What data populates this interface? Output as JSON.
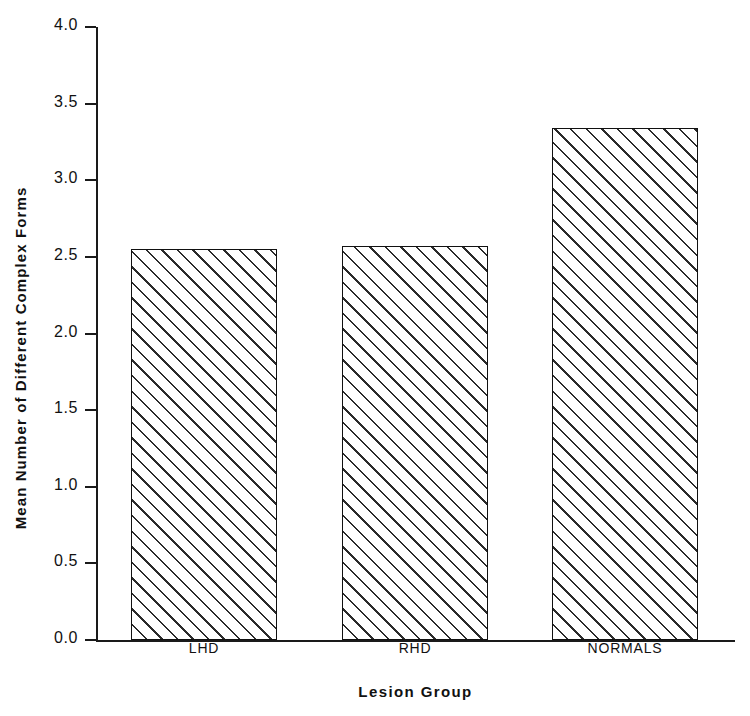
{
  "chart_data": {
    "type": "bar",
    "title": "",
    "xlabel": "Lesion Group",
    "ylabel": "Mean Number of Different Complex Forms",
    "categories": [
      "LHD",
      "RHD",
      "NORMALS"
    ],
    "values": [
      2.55,
      2.57,
      3.34
    ],
    "ylim": [
      0.0,
      4.0
    ],
    "yticks": [
      "0.0",
      "0.5",
      "1.0",
      "1.5",
      "2.0",
      "2.5",
      "3.0",
      "3.5",
      "4.0"
    ],
    "ytick_values": [
      0.0,
      0.5,
      1.0,
      1.5,
      2.0,
      2.5,
      3.0,
      3.5,
      4.0
    ],
    "xticks": [],
    "grid": false,
    "legend": false,
    "legend_position": "none",
    "bar_fill": "hatched-45-diagonal",
    "bar_edge_color": "#111111",
    "background_color": "#ffffff",
    "series": [
      {
        "name": "Mean Number of Different Complex Forms",
        "values": [
          2.55,
          2.57,
          3.34
        ]
      }
    ]
  }
}
